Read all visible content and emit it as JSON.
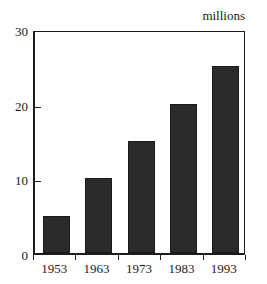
{
  "chart_data": {
    "type": "bar",
    "title": "",
    "subtitle": "",
    "unit_label": "millions",
    "categories": [
      "1953",
      "1963",
      "1973",
      "1983",
      "1993"
    ],
    "values": [
      5,
      20,
      15,
      20,
      25
    ],
    "series": [
      {
        "name": "",
        "values": [
          5,
          10,
          15,
          20,
          25
        ]
      }
    ],
    "xlabel": "",
    "ylabel": "millions",
    "ylim": [
      0,
      30
    ],
    "xlim": [
      0,
      5
    ],
    "yticks": [
      0,
      10,
      20,
      30
    ],
    "ytick_labels": [
      "0",
      "10",
      "20",
      "30"
    ],
    "grid": false,
    "legend": false,
    "legend_position": "none",
    "bar_color": "#2b2b2b",
    "axis_color": "#1c1c1c",
    "background_color": "#ffffff",
    "annotations": []
  },
  "axes": {
    "y_tick_labels": [
      "30",
      "20",
      "10",
      "0"
    ],
    "y_tick_values": [
      30,
      20,
      10,
      0
    ]
  },
  "bars": [
    {
      "category": "1953",
      "value": 5
    },
    {
      "category": "1963",
      "value": 10
    },
    {
      "category": "1973",
      "value": 15
    },
    {
      "category": "1983",
      "value": 20
    },
    {
      "category": "1993",
      "value": 25
    }
  ],
  "caption": {
    "unit": "millions"
  }
}
